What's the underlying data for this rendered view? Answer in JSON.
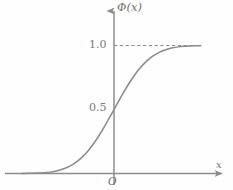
{
  "figure": {
    "name": "standard-normal-cdf-plot",
    "background_color": "#fefefe",
    "axis_color": "#8c8c8c",
    "curve_color": "#8a8a8a",
    "dashed_color": "#8a8a8a",
    "text_color": "#7a7a7a"
  },
  "labels": {
    "y_axis": "Φ(x)",
    "x_axis": "x",
    "origin": "O",
    "tick_one": "1.0",
    "tick_half": "0.5"
  },
  "chart_data": {
    "type": "line",
    "title": "",
    "subtitle": "",
    "xlabel": "x",
    "ylabel": "Φ(x)",
    "xlim": [
      -3.6,
      3.6
    ],
    "ylim": [
      0.0,
      1.12
    ],
    "grid": false,
    "legend": null,
    "x_tick_labels": [
      "O"
    ],
    "x_ticks": [
      0
    ],
    "y_tick_labels": [
      "0.5",
      "1.0"
    ],
    "y_ticks": [
      0.5,
      1.0
    ],
    "annotations": [
      {
        "name": "asymptote-dashed-line",
        "kind": "horizontal-dashed-line",
        "y": 1.0,
        "x_start": 0.0,
        "x_end": 3.1,
        "label": "1.0"
      }
    ],
    "series": [
      {
        "name": "Phi(x) standard normal CDF",
        "style": "solid",
        "x": [
          -3.3,
          -3.1,
          -2.9,
          -2.7,
          -2.5,
          -2.3,
          -2.1,
          -1.9,
          -1.7,
          -1.5,
          -1.3,
          -1.1,
          -0.9,
          -0.7,
          -0.5,
          -0.3,
          -0.1,
          0.0,
          0.1,
          0.3,
          0.5,
          0.7,
          0.9,
          1.1,
          1.3,
          1.5,
          1.7,
          1.9,
          2.1,
          2.3,
          2.5,
          2.7,
          2.9,
          3.1
        ],
        "y": [
          0.0005,
          0.001,
          0.0019,
          0.0035,
          0.0062,
          0.0107,
          0.0179,
          0.0287,
          0.0446,
          0.0668,
          0.0968,
          0.1357,
          0.1841,
          0.242,
          0.3085,
          0.3821,
          0.4602,
          0.5,
          0.5398,
          0.6179,
          0.6915,
          0.758,
          0.8159,
          0.8643,
          0.9032,
          0.9332,
          0.9554,
          0.9713,
          0.9821,
          0.9893,
          0.9938,
          0.9965,
          0.9981,
          0.999
        ]
      }
    ]
  }
}
